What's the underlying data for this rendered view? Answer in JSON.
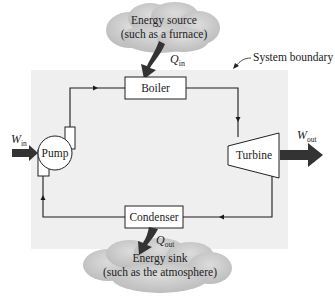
{
  "diagram": {
    "type": "rankine-cycle-schematic",
    "system_boundary_label": "System boundary",
    "components": {
      "boiler": "Boiler",
      "pump": "Pump",
      "turbine": "Turbine",
      "condenser": "Condenser"
    },
    "energy_source": {
      "line1": "Energy source",
      "line2": "(such as a furnace)"
    },
    "energy_sink": {
      "line1": "Energy sink",
      "line2": "(such as the atmosphere)"
    },
    "flows": {
      "q_in": {
        "symbol": "Q",
        "subscript": "in"
      },
      "q_out": {
        "symbol": "Q",
        "subscript": "out"
      },
      "w_in": {
        "symbol": "W",
        "subscript": "in"
      },
      "w_out": {
        "symbol": "W",
        "subscript": "out"
      }
    },
    "colors": {
      "boundary_fill": "#efefef",
      "arrow": "#333333",
      "cloud": "#c9c9c9",
      "line": "#1a1a1a"
    }
  }
}
